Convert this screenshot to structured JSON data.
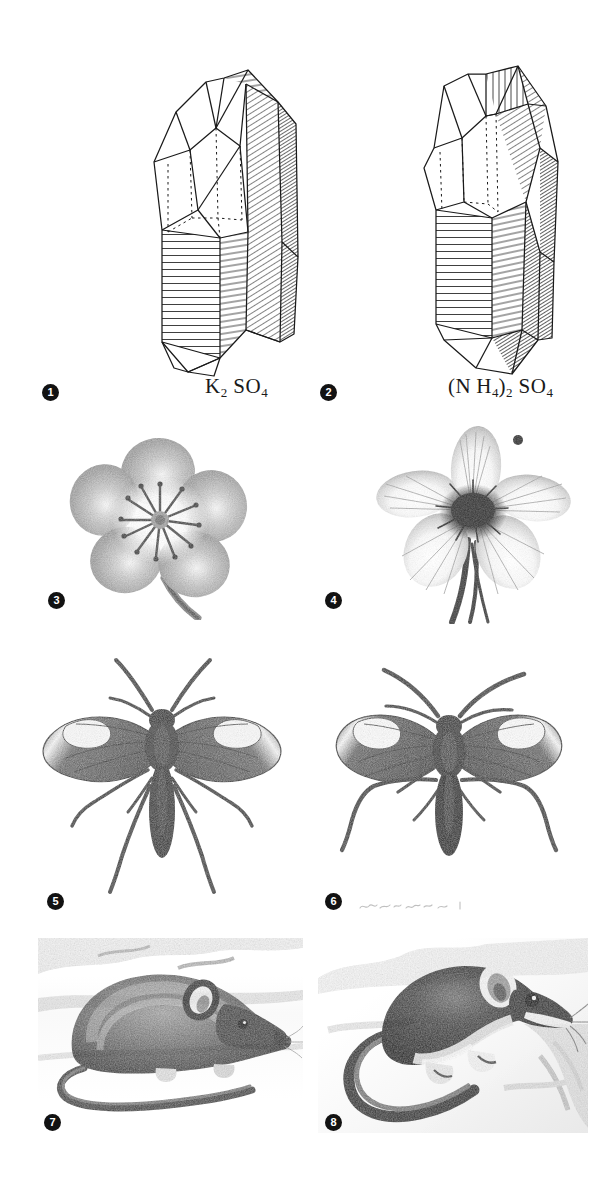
{
  "plate": {
    "background_color": "#ffffff",
    "ink_color": "#1a1a1a",
    "width": 615,
    "height": 1181,
    "rows": 4,
    "columns": 2,
    "figure_count": 8
  },
  "figures": [
    {
      "number": "1",
      "subject": "crystal",
      "caption": "K2SO4",
      "caption_parts": [
        {
          "text": "K",
          "sub": false
        },
        {
          "text": "2",
          "sub": true
        },
        {
          "text": " SO",
          "sub": false
        },
        {
          "text": "4",
          "sub": true
        }
      ],
      "description": "line-drawing of potassium sulphate crystal"
    },
    {
      "number": "2",
      "subject": "crystal",
      "caption": "(NH4)2SO4",
      "caption_parts": [
        {
          "text": "(N H",
          "sub": false
        },
        {
          "text": "4",
          "sub": true
        },
        {
          "text": ")",
          "sub": false
        },
        {
          "text": "2",
          "sub": true
        },
        {
          "text": " SO",
          "sub": false
        },
        {
          "text": "4",
          "sub": true
        }
      ],
      "description": "line-drawing of ammonium sulphate crystal"
    },
    {
      "number": "3",
      "subject": "flower",
      "caption": "",
      "description": "five-petalled dark flower, halftone"
    },
    {
      "number": "4",
      "subject": "flower",
      "caption": "",
      "description": "five-petalled pale flower with dark centre, halftone"
    },
    {
      "number": "5",
      "subject": "insect",
      "caption": "",
      "description": "winged insect with long legs, halftone"
    },
    {
      "number": "6",
      "subject": "insect",
      "caption": "",
      "description": "winged insect with long legs, halftone"
    },
    {
      "number": "7",
      "subject": "mouse",
      "caption": "",
      "description": "mouse in profile facing right, halftone photograph"
    },
    {
      "number": "8",
      "subject": "mouse",
      "caption": "",
      "description": "mouse climbing, facing right, halftone photograph"
    }
  ],
  "bullets": [
    {
      "label": "1",
      "x": 42,
      "y": 384
    },
    {
      "label": "2",
      "x": 320,
      "y": 384
    },
    {
      "label": "3",
      "x": 48,
      "y": 592
    },
    {
      "label": "4",
      "x": 325,
      "y": 592
    },
    {
      "label": "5",
      "x": 47,
      "y": 893
    },
    {
      "label": "6",
      "x": 325,
      "y": 893
    },
    {
      "label": "7",
      "x": 44,
      "y": 1114
    },
    {
      "label": "8",
      "x": 325,
      "y": 1114
    }
  ],
  "captions": [
    {
      "figure": "1",
      "x": 205,
      "y": 374
    },
    {
      "figure": "2",
      "x": 450,
      "y": 374
    }
  ]
}
